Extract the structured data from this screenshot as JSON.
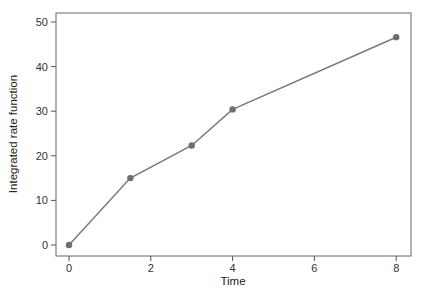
{
  "chart_data": {
    "type": "line",
    "title": "",
    "xlabel": "Time",
    "ylabel": "Integrated rate function",
    "x": [
      0,
      1.5,
      3,
      4,
      8
    ],
    "values": [
      0,
      15,
      22.3,
      30.4,
      46.6
    ],
    "series": [
      {
        "name": "Integrated rate function",
        "x": [
          0,
          1.5,
          3,
          4,
          8
        ],
        "values": [
          0,
          15,
          22.3,
          30.4,
          46.6
        ]
      }
    ],
    "xticks": [
      0,
      2,
      4,
      6,
      8
    ],
    "yticks": [
      0,
      10,
      20,
      30,
      40,
      50
    ],
    "xlim": [
      -0.3,
      8.3
    ],
    "ylim": [
      -2.5,
      52
    ],
    "grid": false,
    "legend": null,
    "markers": true,
    "colors": {
      "line": "#7a7a7a",
      "marker": "#6e6e6e",
      "axis": "#555555"
    }
  }
}
